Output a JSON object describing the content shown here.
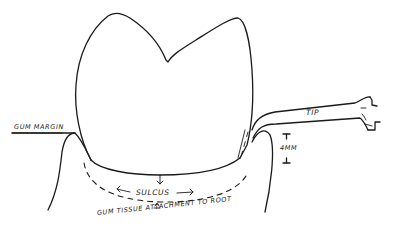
{
  "diagram": {
    "labels": {
      "gum_margin": "GUM MARGIN",
      "tip": "TIP",
      "measure": "4MM",
      "sulcus": "SULCUS",
      "attachment": "GUM TISSUE ATTACHMENT TO ROOT"
    },
    "colors": {
      "ink": "#1a1a1a",
      "background": "#ffffff"
    }
  }
}
